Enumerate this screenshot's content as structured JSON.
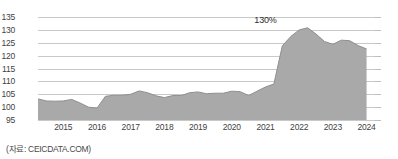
{
  "source_note": "(자료: CEICDATA.COM)",
  "annotation": {
    "label": "130%",
    "at_x": 2021.0,
    "at_y": 130.8
  },
  "axis": {
    "y_ticks": [
      95,
      100,
      105,
      110,
      115,
      120,
      125,
      130,
      135
    ],
    "x_ticks": [
      2015,
      2016,
      2017,
      2018,
      2019,
      2020,
      2021,
      2022,
      2023,
      2024
    ]
  },
  "colors": {
    "fill": "#a9a9a9",
    "stroke": "#8f8f8f",
    "gridline": "#c9c9c9",
    "text": "#3f3f3f"
  },
  "chart_data": {
    "type": "area",
    "title": "",
    "subtitle": "",
    "xlabel": "",
    "ylabel": "",
    "xlim": [
      2014.25,
      2024.25
    ],
    "ylim": [
      95,
      135
    ],
    "grid": true,
    "legend": null,
    "unit": "%",
    "series": [
      {
        "name": "Household Debt to GDP",
        "x": [
          2014.25,
          2014.5,
          2014.75,
          2015.0,
          2015.25,
          2015.5,
          2015.75,
          2016.0,
          2016.25,
          2016.5,
          2016.75,
          2017.0,
          2017.25,
          2017.5,
          2017.75,
          2018.0,
          2018.25,
          2018.5,
          2018.75,
          2019.0,
          2019.25,
          2019.5,
          2019.75,
          2020.0,
          2020.25,
          2020.5,
          2020.75,
          2021.0,
          2021.25,
          2021.5,
          2021.75,
          2022.0,
          2022.25,
          2022.5,
          2022.75,
          2023.0,
          2023.25,
          2023.5,
          2023.75,
          2024.0
        ],
        "values": [
          103.2,
          102.4,
          102.3,
          102.4,
          103.0,
          101.6,
          100.0,
          99.6,
          104.2,
          104.6,
          104.6,
          105.0,
          106.3,
          105.6,
          104.4,
          103.7,
          104.5,
          104.5,
          105.6,
          105.9,
          105.2,
          105.4,
          105.4,
          106.2,
          106.0,
          104.5,
          106.2,
          107.8,
          109.0,
          123.8,
          127.4,
          130.0,
          130.8,
          128.4,
          125.5,
          124.4,
          126.0,
          125.8,
          123.9,
          122.6
        ]
      }
    ]
  }
}
